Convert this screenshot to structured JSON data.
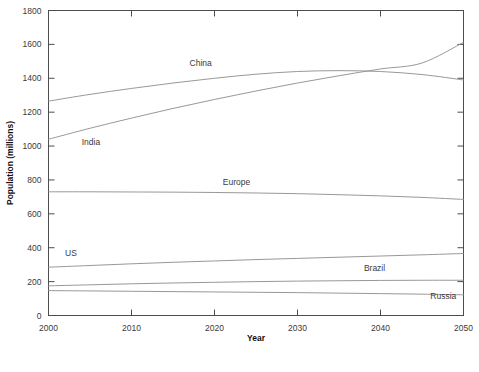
{
  "chart_data": {
    "type": "line",
    "title": "",
    "xlabel": "Year",
    "ylabel": "Population (millions)",
    "xlim": [
      2000,
      2050
    ],
    "ylim": [
      0,
      1800
    ],
    "xticks": [
      2000,
      2010,
      2020,
      2030,
      2040,
      2050
    ],
    "xtick_labels": [
      "2000",
      "2010",
      "2020",
      "2030",
      "2040",
      "2050"
    ],
    "yticks": [
      0,
      200,
      400,
      600,
      800,
      1000,
      1200,
      1400,
      1600,
      1800
    ],
    "ytick_labels": [
      "0",
      "200",
      "400",
      "600",
      "800",
      "1000",
      "1200",
      "1400",
      "1600",
      "1800"
    ],
    "grid": false,
    "legend_position": "inline-labels",
    "line_color": "#8c8c8c",
    "x": [
      2000,
      2005,
      2010,
      2015,
      2020,
      2025,
      2030,
      2035,
      2040,
      2045,
      2050
    ],
    "series": [
      {
        "name": "China",
        "label": "China",
        "values": [
          1265,
          1305,
          1340,
          1372,
          1400,
          1424,
          1440,
          1445,
          1440,
          1422,
          1390
        ]
      },
      {
        "name": "India",
        "label": "India",
        "values": [
          1040,
          1105,
          1165,
          1222,
          1275,
          1325,
          1372,
          1415,
          1455,
          1490,
          1612
        ]
      },
      {
        "name": "Europe",
        "label": "Europe",
        "values": [
          730,
          730,
          729,
          728,
          726,
          723,
          719,
          713,
          706,
          697,
          685
        ]
      },
      {
        "name": "US",
        "label": "US",
        "values": [
          285,
          295,
          305,
          314,
          322,
          330,
          337,
          344,
          351,
          358,
          366
        ]
      },
      {
        "name": "Brazil",
        "label": "Brazil",
        "values": [
          175,
          181,
          187,
          192,
          196,
          200,
          203,
          205,
          207,
          208,
          208
        ]
      },
      {
        "name": "Russia",
        "label": "Russia",
        "values": [
          147,
          145,
          143,
          141,
          139,
          137,
          135,
          132,
          129,
          126,
          122
        ]
      }
    ],
    "annotations": [
      {
        "text": "China",
        "x": 2017,
        "y": 1475
      },
      {
        "text": "India",
        "x": 2004,
        "y": 1005
      },
      {
        "text": "Europe",
        "x": 2021,
        "y": 770
      },
      {
        "text": "US",
        "x": 2002,
        "y": 350
      },
      {
        "text": "Brazil",
        "x": 2038,
        "y": 262
      },
      {
        "text": "Russia",
        "x": 2046,
        "y": 100
      }
    ]
  }
}
